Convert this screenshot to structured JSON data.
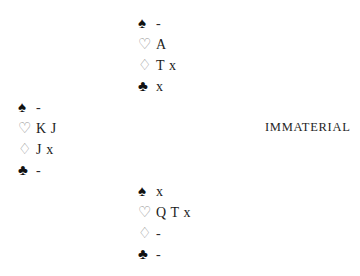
{
  "diagram": {
    "type": "bridge-hand-diagram",
    "suit_symbols": {
      "spades": "♠",
      "hearts": "♡",
      "diamonds": "♢",
      "clubs": "♣"
    },
    "void_mark": "-",
    "hands": {
      "north": {
        "position_label": "North",
        "rows": [
          {
            "suit": "spades",
            "symbol": "♠",
            "style": "black",
            "holding": "-"
          },
          {
            "suit": "hearts",
            "symbol": "♡",
            "style": "hollow",
            "holding": "A"
          },
          {
            "suit": "diamonds",
            "symbol": "♢",
            "style": "hollow",
            "holding": "T x"
          },
          {
            "suit": "clubs",
            "symbol": "♣",
            "style": "black",
            "holding": "x"
          }
        ]
      },
      "west": {
        "position_label": "West",
        "rows": [
          {
            "suit": "spades",
            "symbol": "♠",
            "style": "black",
            "holding": "-"
          },
          {
            "suit": "hearts",
            "symbol": "♡",
            "style": "hollow",
            "holding": "K J"
          },
          {
            "suit": "diamonds",
            "symbol": "♢",
            "style": "hollow",
            "holding": "J x"
          },
          {
            "suit": "clubs",
            "symbol": "♣",
            "style": "black",
            "holding": "-"
          }
        ]
      },
      "south": {
        "position_label": "South",
        "rows": [
          {
            "suit": "spades",
            "symbol": "♠",
            "style": "black",
            "holding": "x"
          },
          {
            "suit": "hearts",
            "symbol": "♡",
            "style": "hollow",
            "holding": "Q T x"
          },
          {
            "suit": "diamonds",
            "symbol": "♢",
            "style": "hollow",
            "holding": "-"
          },
          {
            "suit": "clubs",
            "symbol": "♣",
            "style": "black",
            "holding": "-"
          }
        ]
      },
      "east": {
        "position_label": "East",
        "note": "IMMATERIAL"
      }
    }
  },
  "colors": {
    "background": "#ffffff",
    "solid_suit": "#111111",
    "hollow_suit": "#8e8e8e",
    "text": "#1c1c1c"
  }
}
